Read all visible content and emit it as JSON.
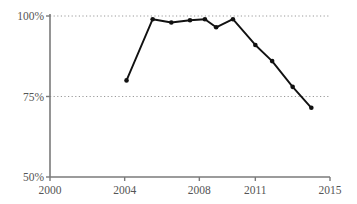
{
  "chart_data": {
    "type": "line",
    "title": "",
    "xlabel": "",
    "ylabel": "",
    "xlim": [
      2000,
      2015
    ],
    "ylim": [
      50,
      100
    ],
    "xticks": [
      2000,
      2004,
      2008,
      2011,
      2015
    ],
    "xtick_labels": [
      "2000",
      "2004",
      "2008",
      "2011",
      "2015"
    ],
    "yticks": [
      50,
      75,
      100
    ],
    "ytick_labels": [
      "50%",
      "75%",
      "100%"
    ],
    "grid": "horizontal-dotted",
    "legend": null,
    "series": [
      {
        "name": "series-1",
        "color": "#111111",
        "marker": "circle",
        "x": [
          2004.1,
          2005.5,
          2006.5,
          2007.5,
          2008.3,
          2008.9,
          2009.8,
          2011.0,
          2011.9,
          2013.0,
          2014.0
        ],
        "y": [
          80.0,
          99.0,
          98.0,
          98.7,
          99.0,
          96.5,
          99.0,
          91.0,
          86.0,
          78.0,
          71.5
        ]
      }
    ]
  },
  "axes": {
    "axis_color": "#7a7a7a",
    "grid_color": "#9a9a9a",
    "label_color": "#555555"
  }
}
